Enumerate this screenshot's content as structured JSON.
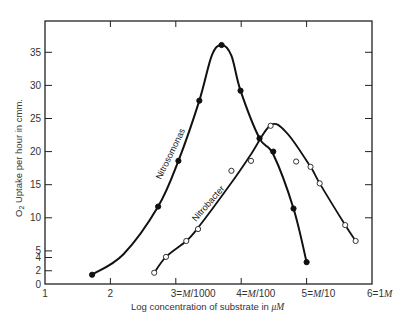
{
  "chart_data": {
    "type": "line",
    "title": "",
    "xlabel": "Log concentration of substrate in μM",
    "ylabel": "O₂ Uptake per hour in cmm.",
    "xlim": [
      1,
      6
    ],
    "ylim": [
      0,
      39
    ],
    "grid": false,
    "legend": "none (curves labeled inline)",
    "x_ticks": [
      {
        "value": 1,
        "label": "1"
      },
      {
        "value": 2,
        "label": "2"
      },
      {
        "value": 3,
        "label": "3=M/1000",
        "num": "3=",
        "unit": "M",
        "den": "/1000"
      },
      {
        "value": 4,
        "label": "4=M/100",
        "num": "4=",
        "unit": "M",
        "den": "/100"
      },
      {
        "value": 5,
        "label": "5=M/10",
        "num": "5=",
        "unit": "M",
        "den": "/10"
      },
      {
        "value": 6,
        "label": "6=1M",
        "num": "6=1",
        "unit": "M",
        "den": ""
      }
    ],
    "y_ticks": [
      0,
      2,
      4,
      5,
      10,
      15,
      20,
      25,
      30,
      35
    ],
    "series": [
      {
        "name": "Nitrosomonas",
        "marker": "filled-circle",
        "label_text": "Nitrosomonas",
        "points": [
          [
            1.72,
            1.4
          ],
          [
            2.73,
            11.7
          ],
          [
            3.04,
            18.6
          ],
          [
            3.36,
            27.7
          ],
          [
            3.7,
            36.1
          ],
          [
            3.99,
            29.2
          ],
          [
            4.28,
            22.0
          ],
          [
            4.49,
            20.0
          ],
          [
            4.8,
            11.4
          ],
          [
            5.0,
            3.3
          ]
        ]
      },
      {
        "name": "Nitrobacter",
        "marker": "open-circle",
        "label_text": "Nitrobacter",
        "points": [
          [
            2.67,
            1.7
          ],
          [
            2.85,
            4.1
          ],
          [
            3.16,
            6.5
          ],
          [
            3.34,
            8.3
          ],
          [
            3.85,
            17.1
          ],
          [
            4.15,
            18.6
          ],
          [
            4.45,
            23.9
          ],
          [
            4.84,
            18.5
          ],
          [
            5.06,
            17.7
          ],
          [
            5.2,
            15.2
          ],
          [
            5.59,
            8.9
          ],
          [
            5.75,
            6.5
          ]
        ]
      }
    ]
  }
}
